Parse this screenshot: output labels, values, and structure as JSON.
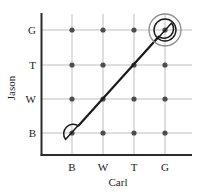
{
  "chart_data": {
    "type": "scatter",
    "title": "",
    "xlabel": "Carl",
    "ylabel": "Jason",
    "categories_x": [
      "B",
      "W",
      "T",
      "G"
    ],
    "categories_y": [
      "B",
      "W",
      "T",
      "G"
    ],
    "ytick_labels_top_to_bottom": [
      "G",
      "T",
      "W",
      "B"
    ],
    "grid": true,
    "legend": null,
    "points": [
      {
        "x": "B",
        "y": "B"
      },
      {
        "x": "W",
        "y": "B"
      },
      {
        "x": "T",
        "y": "B"
      },
      {
        "x": "G",
        "y": "B"
      },
      {
        "x": "B",
        "y": "W"
      },
      {
        "x": "W",
        "y": "W"
      },
      {
        "x": "T",
        "y": "W"
      },
      {
        "x": "G",
        "y": "W"
      },
      {
        "x": "B",
        "y": "T"
      },
      {
        "x": "W",
        "y": "T"
      },
      {
        "x": "T",
        "y": "T"
      },
      {
        "x": "G",
        "y": "T"
      },
      {
        "x": "B",
        "y": "G"
      },
      {
        "x": "W",
        "y": "G"
      },
      {
        "x": "T",
        "y": "G"
      },
      {
        "x": "G",
        "y": "G"
      }
    ],
    "annotations": [
      {
        "shape": "capsule",
        "description": "elongated rounded outline enclosing the diagonal where Carl equals Jason",
        "from": {
          "x": "B",
          "y": "B"
        },
        "to": {
          "x": "G",
          "y": "G"
        },
        "color": "#1a1a1a"
      },
      {
        "shape": "circle",
        "description": "inner highlight circle on the Carl G, Jason G point",
        "center": {
          "x": "G",
          "y": "G"
        },
        "radius_px": 11,
        "color": "#1a1a1a"
      },
      {
        "shape": "circle",
        "description": "outer highlight circle on the Carl G, Jason G point",
        "center": {
          "x": "G",
          "y": "G"
        },
        "radius_px": 16,
        "color": "#8c8c8c"
      }
    ],
    "colors": {
      "point": "#4d4d4d",
      "axis": "#2b2b2b",
      "grid": "#b3b3b3",
      "annotation": "#1a1a1a",
      "highlight_outer": "#8c8c8c",
      "background": "#ffffff"
    },
    "geometry": {
      "x_positions_px": {
        "B": 72,
        "W": 103,
        "T": 134,
        "G": 165
      },
      "y_positions_px": {
        "G": 30,
        "T": 65,
        "W": 99,
        "B": 133
      },
      "axis_x_px": 41,
      "axis_y_px": 155
    }
  }
}
